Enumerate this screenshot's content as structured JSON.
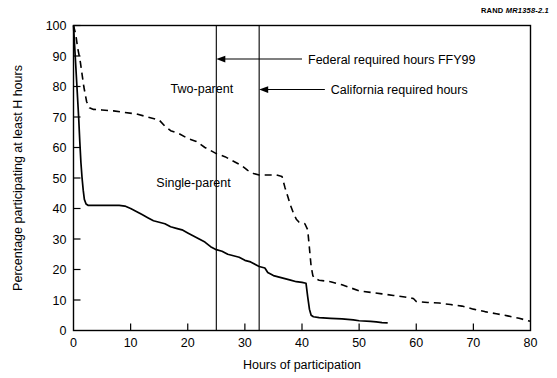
{
  "figure": {
    "source_note_bold": "RAND",
    "source_note_italic": "MR1358-2.1"
  },
  "chart_data": {
    "type": "line",
    "title": "",
    "xlabel": "Hours of participation",
    "ylabel": "Percentage participating at least H hours",
    "xlim": [
      0,
      80
    ],
    "ylim": [
      0,
      100
    ],
    "xticks": [
      0,
      10,
      20,
      30,
      40,
      50,
      60,
      70,
      80
    ],
    "yticks": [
      0,
      10,
      20,
      30,
      40,
      50,
      60,
      70,
      80,
      90,
      100
    ],
    "xtick_labels": [
      "0",
      "10",
      "20",
      "30",
      "40",
      "50",
      "60",
      "70",
      "80"
    ],
    "ytick_labels": [
      "0",
      "10",
      "20",
      "30",
      "40",
      "50",
      "60",
      "70",
      "80",
      "90",
      "100"
    ],
    "grid": false,
    "legend_position": "inline-labels",
    "series": [
      {
        "name": "Two-parent",
        "style": "dashed",
        "color": "#000000",
        "label_x": 17,
        "label_y": 78,
        "points": [
          [
            0,
            100
          ],
          [
            0.4,
            97
          ],
          [
            0.7,
            93
          ],
          [
            1.0,
            90
          ],
          [
            1.2,
            88
          ],
          [
            1.5,
            84
          ],
          [
            1.8,
            80
          ],
          [
            2.0,
            78
          ],
          [
            2.3,
            75
          ],
          [
            2.8,
            73
          ],
          [
            3.5,
            72.5
          ],
          [
            5,
            72.3
          ],
          [
            7,
            72
          ],
          [
            9,
            71.5
          ],
          [
            11,
            71
          ],
          [
            13,
            70
          ],
          [
            15,
            69
          ],
          [
            16,
            67
          ],
          [
            17,
            65.5
          ],
          [
            18.5,
            64.5
          ],
          [
            20,
            63
          ],
          [
            21.5,
            62
          ],
          [
            23,
            60
          ],
          [
            24,
            59
          ],
          [
            25,
            58
          ],
          [
            26.5,
            57
          ],
          [
            28,
            55.5
          ],
          [
            29.5,
            54
          ],
          [
            30.5,
            52.5
          ],
          [
            31.5,
            51.5
          ],
          [
            32.5,
            51
          ],
          [
            34,
            51
          ],
          [
            35.5,
            51
          ],
          [
            36.5,
            50.5
          ],
          [
            37,
            47
          ],
          [
            37.5,
            44
          ],
          [
            38,
            41
          ],
          [
            38.5,
            38.5
          ],
          [
            39,
            36.5
          ],
          [
            39.5,
            35.5
          ],
          [
            40.5,
            35
          ],
          [
            41,
            33
          ],
          [
            41.3,
            27
          ],
          [
            41.6,
            21
          ],
          [
            41.9,
            18
          ],
          [
            42.2,
            17
          ],
          [
            43,
            16.5
          ],
          [
            45,
            16
          ],
          [
            47,
            15
          ],
          [
            48.5,
            14
          ],
          [
            50,
            13
          ],
          [
            52,
            12.5
          ],
          [
            54,
            12
          ],
          [
            56,
            11.5
          ],
          [
            58,
            11
          ],
          [
            59.5,
            10.5
          ],
          [
            60,
            9.5
          ],
          [
            62,
            9.2
          ],
          [
            64,
            9
          ],
          [
            66,
            8.5
          ],
          [
            68,
            8
          ],
          [
            70,
            7
          ],
          [
            72,
            6.2
          ],
          [
            74,
            5.5
          ],
          [
            76,
            4.8
          ],
          [
            78,
            4
          ],
          [
            79,
            3.5
          ],
          [
            80,
            3
          ]
        ]
      },
      {
        "name": "Single-parent",
        "style": "solid",
        "color": "#000000",
        "label_x": 14.5,
        "label_y": 47,
        "points": [
          [
            0,
            100
          ],
          [
            0.3,
            90
          ],
          [
            0.6,
            80
          ],
          [
            0.9,
            70
          ],
          [
            1.1,
            62
          ],
          [
            1.3,
            55
          ],
          [
            1.5,
            50
          ],
          [
            1.7,
            46
          ],
          [
            1.9,
            43
          ],
          [
            2.2,
            41.5
          ],
          [
            2.6,
            41
          ],
          [
            4,
            41
          ],
          [
            6,
            41
          ],
          [
            8,
            41
          ],
          [
            9,
            40.8
          ],
          [
            10,
            40
          ],
          [
            11,
            39
          ],
          [
            12,
            38
          ],
          [
            13,
            37
          ],
          [
            14,
            36
          ],
          [
            15,
            35.5
          ],
          [
            16,
            35
          ],
          [
            17,
            34
          ],
          [
            18,
            33.5
          ],
          [
            19,
            33
          ],
          [
            20,
            32
          ],
          [
            21,
            31
          ],
          [
            22,
            30
          ],
          [
            23,
            29
          ],
          [
            24,
            27.5
          ],
          [
            25,
            26.5
          ],
          [
            26,
            26
          ],
          [
            27,
            25
          ],
          [
            28,
            24.5
          ],
          [
            29,
            24
          ],
          [
            30,
            23
          ],
          [
            31,
            22.5
          ],
          [
            32,
            21.5
          ],
          [
            32.5,
            21
          ],
          [
            33.5,
            20.5
          ],
          [
            34,
            19
          ],
          [
            35,
            18
          ],
          [
            36,
            17.5
          ],
          [
            37,
            17
          ],
          [
            38,
            16.5
          ],
          [
            39,
            16
          ],
          [
            40,
            15.8
          ],
          [
            40.7,
            15.5
          ],
          [
            41,
            11
          ],
          [
            41.3,
            7
          ],
          [
            41.6,
            5
          ],
          [
            42,
            4.5
          ],
          [
            43,
            4.2
          ],
          [
            45,
            4
          ],
          [
            47,
            3.8
          ],
          [
            49,
            3.5
          ],
          [
            50,
            3.2
          ],
          [
            52,
            3
          ],
          [
            53,
            2.8
          ],
          [
            54,
            2.6
          ],
          [
            55,
            2.5
          ]
        ]
      }
    ],
    "reference_lines": [
      {
        "name": "federal-required-hours",
        "x": 25,
        "label": "Federal required hours FFY99",
        "label_x": 40,
        "label_y": 89,
        "arrow_from_x": 40,
        "arrow_to_x": 25,
        "arrow_y": 89
      },
      {
        "name": "california-required-hours",
        "x": 32.5,
        "label": "California required hours",
        "label_x": 44,
        "label_y": 79,
        "arrow_from_x": 44,
        "arrow_to_x": 32.5,
        "arrow_y": 79
      }
    ]
  }
}
